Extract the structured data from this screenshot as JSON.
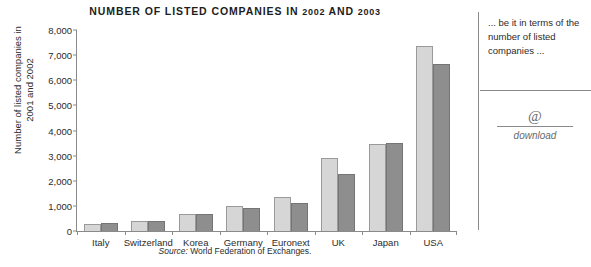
{
  "chart_data": {
    "type": "bar",
    "title": "NUMBER OF LISTED COMPANIES IN 2002 AND 2003",
    "title_prefix": "NUMBER OF LISTED COMPANIES IN ",
    "title_year1": "2002",
    "title_joiner": " AND ",
    "title_year2": "2003",
    "xlabel": "",
    "ylabel": "Number of listed companies in 2001 and 2002",
    "ylabel_line1": "Number of listed companies in",
    "ylabel_line2": "2001 and 2002",
    "ylim": [
      0,
      8000
    ],
    "ytick_step": 1000,
    "ytick_labels": [
      "8,000",
      "7,000",
      "6,000",
      "5,000",
      "4,000",
      "3,000",
      "2,000",
      "1,000",
      "0"
    ],
    "ytick_values": [
      8000,
      7000,
      6000,
      5000,
      4000,
      3000,
      2000,
      1000,
      0
    ],
    "grid": false,
    "legend": "none",
    "categories": [
      "Italy",
      "Switzerland",
      "Korea",
      "Germany",
      "Euronext",
      "UK",
      "Japan",
      "USA"
    ],
    "series": [
      {
        "name": "2002",
        "color": "#d6d6d6",
        "values": [
          290,
          400,
          690,
          990,
          1360,
          2890,
          3480,
          7360
        ]
      },
      {
        "name": "2003",
        "color": "#8e8e8e",
        "values": [
          300,
          410,
          670,
          930,
          1120,
          2270,
          3490,
          6650
        ]
      }
    ],
    "source_prefix": "Source:",
    "source_text": "World Federation of Exchanges."
  },
  "sidebar": {
    "note": "... be it in terms of the number of listed companies ...",
    "download_icon": "@",
    "download_label": "download"
  }
}
